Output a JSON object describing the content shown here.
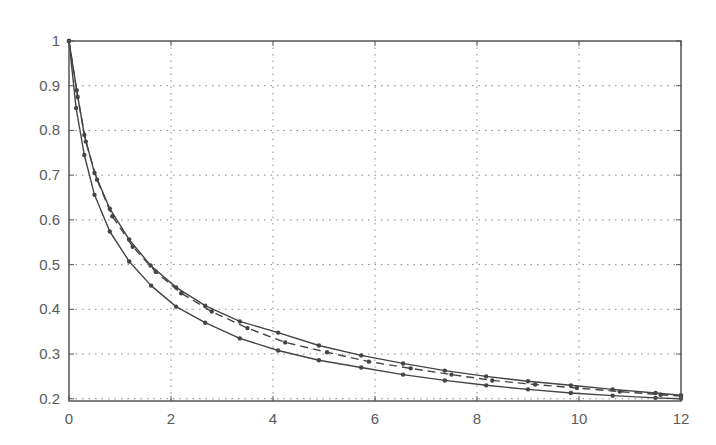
{
  "chart_data": {
    "type": "line",
    "title": "",
    "xlabel": "",
    "ylabel": "",
    "xlim": [
      0,
      12
    ],
    "ylim": [
      0.195,
      1
    ],
    "grid": true,
    "legend": null,
    "xticks": [
      0,
      2,
      4,
      6,
      8,
      10,
      12
    ],
    "yticks": [
      0.2,
      0.3,
      0.4,
      0.5,
      0.6,
      0.7,
      0.8,
      0.9,
      1
    ],
    "xtick_labels": [
      "0",
      "2",
      "4",
      "6",
      "8",
      "10",
      "12"
    ],
    "ytick_labels": [
      "0.2",
      "0.3",
      "0.4",
      "0.5",
      "0.6",
      "0.7",
      "0.8",
      "0.9",
      "1"
    ],
    "series": [
      {
        "name": "upper (solid)",
        "style": "solid",
        "marker": "dot",
        "color": "#444444",
        "x": [
          0,
          0.15,
          0.3,
          0.5,
          0.8,
          1.18,
          1.6,
          2.1,
          2.67,
          3.35,
          4.1,
          4.9,
          5.73,
          6.55,
          7.37,
          8.18,
          9.0,
          9.84,
          10.66,
          11.5,
          12
        ],
        "y": [
          1,
          0.89,
          0.79,
          0.705,
          0.625,
          0.556,
          0.498,
          0.449,
          0.408,
          0.373,
          0.348,
          0.319,
          0.297,
          0.279,
          0.263,
          0.25,
          0.239,
          0.23,
          0.221,
          0.213,
          0.208
        ]
      },
      {
        "name": "middle (dashed)",
        "style": "dashed",
        "marker": "dot",
        "color": "#444444",
        "x": [
          0,
          0.17,
          0.33,
          0.55,
          0.85,
          1.25,
          1.7,
          2.2,
          2.8,
          3.5,
          4.24,
          5.06,
          5.88,
          6.7,
          7.5,
          8.3,
          9.14,
          9.96,
          10.8,
          11.6,
          12
        ],
        "y": [
          1,
          0.875,
          0.775,
          0.69,
          0.608,
          0.54,
          0.484,
          0.436,
          0.395,
          0.358,
          0.326,
          0.304,
          0.283,
          0.268,
          0.254,
          0.241,
          0.232,
          0.224,
          0.216,
          0.209,
          0.206
        ]
      },
      {
        "name": "lower (solid)",
        "style": "solid",
        "marker": "dot",
        "color": "#444444",
        "x": [
          0,
          0.14,
          0.3,
          0.5,
          0.8,
          1.18,
          1.61,
          2.1,
          2.67,
          3.35,
          4.1,
          4.9,
          5.73,
          6.55,
          7.37,
          8.18,
          9.0,
          9.84,
          10.66,
          11.5,
          12
        ],
        "y": [
          1,
          0.85,
          0.745,
          0.656,
          0.574,
          0.507,
          0.453,
          0.406,
          0.37,
          0.335,
          0.308,
          0.286,
          0.27,
          0.254,
          0.241,
          0.23,
          0.221,
          0.213,
          0.207,
          0.202,
          0.2
        ]
      }
    ]
  },
  "style": {
    "axis_color": "#555555",
    "grid_color": "#8a8a8a",
    "line_color": "#444444",
    "label_color": "#5a5a5a"
  }
}
